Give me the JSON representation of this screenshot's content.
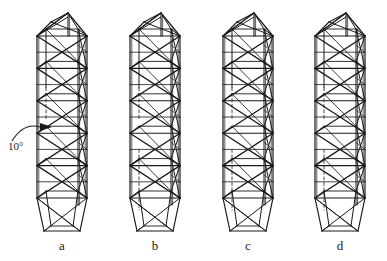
{
  "figure": {
    "type": "engineering-line-drawing",
    "background_color": "#ffffff",
    "line_color": "#1a1a1a",
    "hidden_line_color": "#4a4a4a",
    "width": 387,
    "height": 261
  },
  "annotation": {
    "angle_text": "10°",
    "angle_value": 10,
    "angle_unit": "degrees",
    "target": "tower-a",
    "leader": "curved-arrow"
  },
  "towers": [
    {
      "label": "a",
      "center_x": 62,
      "bays": 5,
      "bracing": "x-brace",
      "hidden_chord_dashed": false,
      "top_cap": "pyramidal",
      "bottom_cap": "tapered"
    },
    {
      "label": "b",
      "center_x": 155,
      "bays": 5,
      "bracing": "x-brace",
      "hidden_chord_dashed": true,
      "top_cap": "pyramidal",
      "bottom_cap": "tapered"
    },
    {
      "label": "c",
      "center_x": 248,
      "bays": 5,
      "bracing": "x-brace",
      "hidden_chord_dashed": true,
      "top_cap": "pyramidal",
      "bottom_cap": "tapered"
    },
    {
      "label": "d",
      "center_x": 340,
      "bays": 5,
      "bracing": "x-brace",
      "hidden_chord_dashed": true,
      "top_cap": "pyramidal",
      "bottom_cap": "tapered"
    }
  ],
  "geometry": {
    "body_top_y": 36,
    "body_bottom_y": 198,
    "apex_y": 13,
    "base_y": 231,
    "half_width": 25,
    "depth_offset_x": 9,
    "depth_offset_y": 7,
    "label_y": 238
  }
}
